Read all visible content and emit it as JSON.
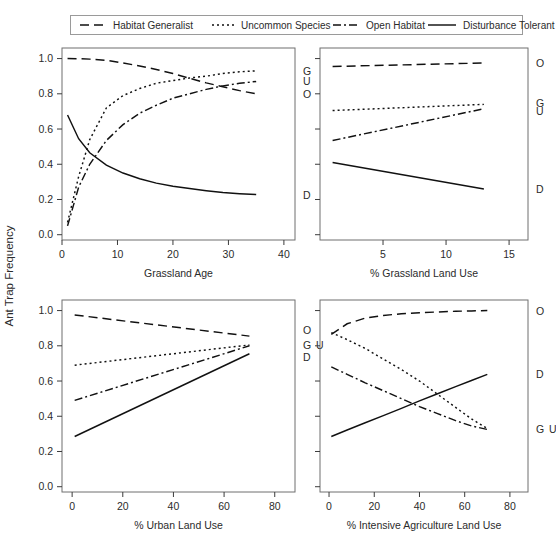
{
  "figure": {
    "ylabel": "Ant Trap Frequency",
    "legend": {
      "position": "top",
      "entries": [
        {
          "label": "Habitat Generalist",
          "code": "G",
          "dash": "9,5"
        },
        {
          "label": "Uncommon Species",
          "code": "U",
          "dash": "2,3"
        },
        {
          "label": "Open Habitat",
          "code": "O",
          "dash": "8,3,2,3"
        },
        {
          "label": "Disturbance Tolerant",
          "code": "D",
          "dash": "none"
        }
      ]
    }
  },
  "chart_data": [
    {
      "type": "line",
      "panel": "top-left",
      "title": "",
      "xlabel": "Grassland Age",
      "ylabel": "Ant Trap Frequency",
      "xlim": [
        0,
        42
      ],
      "ylim": [
        -0.03,
        1.06
      ],
      "xticks": [
        0,
        10,
        20,
        30,
        40
      ],
      "yticks": [
        0.0,
        0.2,
        0.4,
        0.6,
        0.8,
        1.0
      ],
      "yticklabels": [
        "0.0",
        "0.2",
        "0.4",
        "0.6",
        "0.8",
        "1.0"
      ],
      "grid": false,
      "x": [
        1,
        3,
        5,
        8,
        11,
        14,
        17,
        20,
        23,
        26,
        29,
        32,
        35
      ],
      "series": [
        {
          "name": "Habitat Generalist",
          "code": "G",
          "dash": "2,3",
          "values": [
            0.07,
            0.33,
            0.54,
            0.72,
            0.79,
            0.83,
            0.86,
            0.875,
            0.89,
            0.9,
            0.915,
            0.925,
            0.93
          ],
          "endlabel": "G",
          "endlabel_y": 0.93
        },
        {
          "name": "Uncommon Species",
          "code": "U",
          "dash": "8,3,2,3",
          "values": [
            0.05,
            0.27,
            0.4,
            0.535,
            0.625,
            0.69,
            0.735,
            0.775,
            0.8,
            0.825,
            0.845,
            0.86,
            0.87
          ],
          "endlabel": "U",
          "endlabel_y": 0.87
        },
        {
          "name": "Open Habitat",
          "code": "O",
          "dash": "9,5",
          "values": [
            1.0,
            0.999,
            0.997,
            0.99,
            0.975,
            0.958,
            0.938,
            0.915,
            0.888,
            0.862,
            0.84,
            0.818,
            0.8
          ],
          "endlabel": "O",
          "endlabel_y": 0.8
        },
        {
          "name": "Disturbance Tolerant",
          "code": "D",
          "dash": "none",
          "values": [
            0.68,
            0.545,
            0.465,
            0.395,
            0.35,
            0.318,
            0.293,
            0.275,
            0.262,
            0.25,
            0.24,
            0.233,
            0.228
          ],
          "endlabel": "D",
          "endlabel_y": 0.228
        }
      ]
    },
    {
      "type": "line",
      "panel": "top-right",
      "title": "",
      "xlabel": "% Grassland Land Use",
      "ylabel": "Ant Trap Frequency",
      "xlim": [
        0,
        16.5
      ],
      "ylim": [
        -0.03,
        1.06
      ],
      "xticks": [
        5,
        10,
        15
      ],
      "yticks": [
        0.0,
        0.2,
        0.4,
        0.6,
        0.8,
        1.0
      ],
      "yticklabels": [
        "",
        "",
        "",
        "",
        "",
        ""
      ],
      "grid": false,
      "x": [
        1,
        13
      ],
      "series": [
        {
          "name": "Open Habitat",
          "code": "O",
          "dash": "9,5",
          "values": [
            0.955,
            0.975
          ],
          "endlabel": "O",
          "endlabel_y": 0.975
        },
        {
          "name": "Habitat Generalist",
          "code": "G",
          "dash": "2,3",
          "values": [
            0.705,
            0.74
          ],
          "endlabel": "G",
          "endlabel_y": 0.745
        },
        {
          "name": "Uncommon Species",
          "code": "U",
          "dash": "8,3,2,3",
          "values": [
            0.535,
            0.715
          ],
          "endlabel": "U",
          "endlabel_y": 0.7
        },
        {
          "name": "Disturbance Tolerant",
          "code": "D",
          "dash": "none",
          "values": [
            0.41,
            0.26
          ],
          "endlabel": "D",
          "endlabel_y": 0.26
        }
      ]
    },
    {
      "type": "line",
      "panel": "bottom-left",
      "title": "",
      "xlabel": "% Urban Land Use",
      "ylabel": "Ant Trap Frequency",
      "xlim": [
        -4,
        88
      ],
      "ylim": [
        -0.03,
        1.06
      ],
      "xticks": [
        0,
        20,
        40,
        60,
        80
      ],
      "yticks": [
        0.0,
        0.2,
        0.4,
        0.6,
        0.8,
        1.0
      ],
      "yticklabels": [
        "0.0",
        "0.2",
        "0.4",
        "0.6",
        "0.8",
        "1.0"
      ],
      "grid": false,
      "x": [
        1,
        70
      ],
      "series": [
        {
          "name": "Open Habitat",
          "code": "O",
          "dash": "9,5",
          "values": [
            0.975,
            0.855
          ],
          "endlabel": "O",
          "endlabel_y": 0.89
        },
        {
          "name": "Habitat Generalist",
          "code": "G",
          "dash": "2,3",
          "values": [
            0.69,
            0.805
          ],
          "endlabel": "G",
          "endlabel_y": 0.805
        },
        {
          "name": "Uncommon Species",
          "code": "U",
          "dash": "8,3,2,3",
          "values": [
            0.49,
            0.8
          ],
          "endlabel": "U",
          "endlabel_y": 0.805
        },
        {
          "name": "Disturbance Tolerant",
          "code": "D",
          "dash": "none",
          "values": [
            0.285,
            0.755
          ],
          "endlabel": "D",
          "endlabel_y": 0.735
        }
      ]
    },
    {
      "type": "line",
      "panel": "bottom-right",
      "title": "",
      "xlabel": "% Intensive Agriculture Land Use",
      "ylabel": "Ant Trap Frequency",
      "xlim": [
        -4,
        88
      ],
      "ylim": [
        -0.03,
        1.06
      ],
      "xticks": [
        0,
        20,
        40,
        60,
        80
      ],
      "yticks": [
        0.0,
        0.2,
        0.4,
        0.6,
        0.8,
        1.0
      ],
      "yticklabels": [
        "",
        "",
        "",
        "",
        "",
        ""
      ],
      "grid": false,
      "x": [
        1,
        8,
        16,
        24,
        32,
        40,
        48,
        56,
        63,
        70
      ],
      "series": [
        {
          "name": "Open Habitat",
          "code": "O",
          "dash": "9,5",
          "values": [
            0.865,
            0.925,
            0.957,
            0.972,
            0.982,
            0.988,
            0.992,
            0.996,
            0.998,
            1.0
          ],
          "endlabel": "O",
          "endlabel_y": 1.0
        },
        {
          "name": "Habitat Generalist",
          "code": "G",
          "dash": "2,3",
          "values": [
            0.875,
            0.835,
            0.785,
            0.725,
            0.665,
            0.6,
            0.525,
            0.45,
            0.385,
            0.33
          ],
          "endlabel": "G",
          "endlabel_y": 0.325
        },
        {
          "name": "Uncommon Species",
          "code": "U",
          "dash": "8,3,2,3",
          "values": [
            0.68,
            0.638,
            0.59,
            0.545,
            0.5,
            0.455,
            0.415,
            0.375,
            0.345,
            0.325
          ],
          "endlabel": "U",
          "endlabel_y": 0.325
        },
        {
          "name": "Disturbance Tolerant",
          "code": "D",
          "dash": "none",
          "values": [
            0.285,
            0.322,
            0.363,
            0.404,
            0.445,
            0.487,
            0.528,
            0.568,
            0.603,
            0.638
          ],
          "endlabel": "D",
          "endlabel_y": 0.638
        }
      ]
    }
  ]
}
